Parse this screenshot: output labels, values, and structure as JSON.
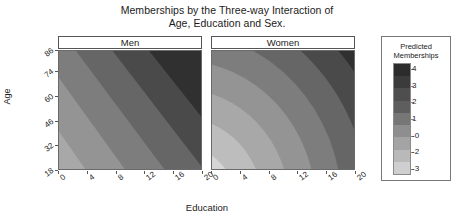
{
  "chart_data": {
    "type": "heatmap",
    "title": "Memberships by the Three-way Interaction of Age, Education and Sex.",
    "title_lines": [
      "Memberships by the Three-way Interaction of",
      "Age, Education and Sex."
    ],
    "xlabel": "Education",
    "ylabel": "Age",
    "xlim": [
      0,
      20
    ],
    "ylim": [
      18,
      86
    ],
    "xticks": [
      0,
      4,
      8,
      12,
      16,
      20
    ],
    "xtick_labels": [
      "0",
      "4",
      "8",
      "12",
      "16",
      "20"
    ],
    "yticks": [
      18,
      32,
      46,
      60,
      74,
      86
    ],
    "ytick_labels": [
      "18",
      "32",
      "46",
      "60",
      "74",
      "86"
    ],
    "grid": false,
    "legend_position": "right",
    "panels": [
      {
        "label": "Men",
        "pattern": "linear-diagonal-bands",
        "description": "Straight diagonal contour bands running from lower-left (light, low predicted memberships) to upper-right (dark, high predicted memberships).",
        "corner_values": {
          "bottom_left": -3,
          "bottom_right": 1.5,
          "top_left": 0.5,
          "top_right": 4
        }
      },
      {
        "label": "Women",
        "pattern": "concentric-curved-arcs",
        "description": "Curved concentric arc contours centred near the lower-left corner; lightest (lowest predicted memberships) at bottom-left, darkening outward toward the top and right.",
        "corner_values": {
          "bottom_left": -3,
          "bottom_right": 2.5,
          "top_left": 2,
          "top_right": 4
        }
      }
    ],
    "colorbar": {
      "title": "Predicted Memberships",
      "title_lines": [
        "Predicted",
        "Memberships"
      ],
      "orientation": "vertical",
      "scale_direction": "dark-high-to-light-low",
      "ticks": [
        4,
        3,
        2,
        1,
        0,
        -2,
        -3
      ],
      "tick_labels": [
        "4",
        "3",
        "2",
        "1",
        "-0",
        "-2",
        "-3"
      ],
      "colors": [
        "#2c2c2c",
        "#3b3b3b",
        "#4e4e4e",
        "#5e5e5e",
        "#767676",
        "#8e8e8e",
        "#a4a4a4",
        "#b9b9b9",
        "#cfcfcf"
      ]
    },
    "palette": {
      "level_minus3": "#d5d5d5",
      "level_minus2": "#bdbdbd",
      "level_minus1": "#a8a8a8",
      "level_0": "#949494",
      "level_1": "#7d7d7d",
      "level_2": "#666666",
      "level_3": "#4a4a4a",
      "level_4": "#303030",
      "panel_border": "#6a6a6a",
      "strip_border": "#555555",
      "text": "#1b1b1b",
      "background": "#ffffff"
    }
  }
}
